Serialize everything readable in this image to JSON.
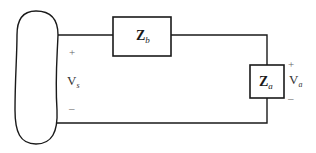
{
  "diagram": {
    "type": "circuit",
    "source": {
      "shape": "blob",
      "voltage_label": "V",
      "voltage_subscript": "s",
      "plus": "+",
      "minus": "–"
    },
    "series_impedance": {
      "label": "Z",
      "subscript": "b"
    },
    "load_impedance": {
      "label": "Z",
      "subscript": "a",
      "voltage_label": "V",
      "voltage_subscript": "a",
      "plus": "+",
      "minus": "–"
    },
    "colors": {
      "line": "#1a1a1a",
      "label": "#333333",
      "background": "#ffffff"
    }
  }
}
